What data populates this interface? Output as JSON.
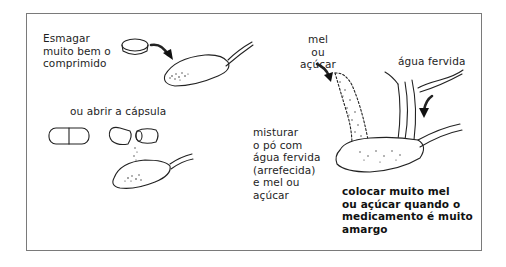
{
  "figure": {
    "border_color": "#7a7a7a",
    "steps": {
      "crush": {
        "text": "Esmagar\nmuito bem o\ncomprimido"
      },
      "capsule": {
        "text": "ou abrir a cápsula"
      },
      "sweetener": {
        "text": "mel\nou\naçúcar"
      },
      "water": {
        "text": "água fervida"
      },
      "mix": {
        "text": "misturar\no pó com\nágua fervida\n(arrefecida)\ne mel ou\naçúcar"
      },
      "bitter_note": {
        "text": "colocar muito mel\nou açúcar quando o\nmedicamento é muito\namargo"
      }
    },
    "icons": [
      "tablet-icon",
      "curved-arrow-icon",
      "spoon-icon",
      "capsule-icon",
      "open-capsule-icon",
      "powder-stream-icon",
      "water-stream-icon"
    ]
  }
}
